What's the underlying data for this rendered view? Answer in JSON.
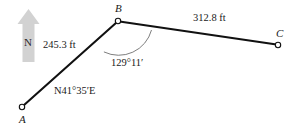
{
  "figure": {
    "type": "surveying-traverse-diagram",
    "background_color": "#ffffff",
    "line_color": "#111111",
    "compass_color": "#d2d2d2",
    "compass": {
      "direction_label": "N",
      "icon": "north-arrow-icon"
    },
    "vertices": [
      {
        "id": "A",
        "label": "A",
        "x": 22,
        "y": 107,
        "label_x": 19,
        "label_y": 114
      },
      {
        "id": "B",
        "label": "B",
        "x": 118,
        "y": 21,
        "label_x": 115,
        "label_y": 4
      },
      {
        "id": "C",
        "label": "C",
        "x": 278,
        "y": 45,
        "label_x": 275,
        "label_y": 29
      }
    ],
    "segments": [
      {
        "id": "AB",
        "from": "A",
        "to": "B",
        "length_label": "245.3 ft",
        "label_x": 43,
        "label_y": 40
      },
      {
        "id": "BC",
        "from": "B",
        "to": "C",
        "length_label": "312.8 ft",
        "label_x": 193,
        "label_y": 13
      }
    ],
    "bearing": {
      "segment": "AB",
      "label": "N41°35′E",
      "label_x": 54,
      "label_y": 86
    },
    "angle": {
      "vertex": "B",
      "label": "129°11′",
      "label_x": 111,
      "label_y": 58,
      "arc_radius": 34
    }
  }
}
